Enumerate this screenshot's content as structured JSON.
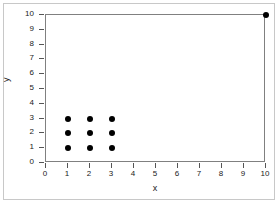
{
  "chart_data": {
    "type": "scatter",
    "title": "",
    "xlabel": "x",
    "ylabel": "y",
    "xlim": [
      0,
      10
    ],
    "ylim": [
      0,
      10
    ],
    "xticks": [
      0,
      1,
      2,
      3,
      4,
      5,
      6,
      7,
      8,
      9,
      10
    ],
    "yticks": [
      0,
      1,
      2,
      3,
      4,
      5,
      6,
      7,
      8,
      9,
      10
    ],
    "xtick_labels": [
      "0",
      "1",
      "2",
      "3",
      "4",
      "5",
      "6",
      "7",
      "8",
      "9",
      "10"
    ],
    "ytick_labels": [
      "0",
      "1",
      "2",
      "3",
      "4",
      "5",
      "6",
      "7",
      "8",
      "9",
      "10"
    ],
    "grid": false,
    "legend": null,
    "marker": "filled-circle",
    "marker_color": "#000000",
    "marker_size": 6,
    "points": [
      {
        "x": 1,
        "y": 1
      },
      {
        "x": 1,
        "y": 2
      },
      {
        "x": 1,
        "y": 3
      },
      {
        "x": 2,
        "y": 1
      },
      {
        "x": 2,
        "y": 2
      },
      {
        "x": 2,
        "y": 3
      },
      {
        "x": 3,
        "y": 1
      },
      {
        "x": 3,
        "y": 2
      },
      {
        "x": 3,
        "y": 3
      },
      {
        "x": 10,
        "y": 10
      }
    ],
    "series": [
      {
        "name": "data",
        "x": [
          1,
          1,
          1,
          2,
          2,
          2,
          3,
          3,
          3,
          10
        ],
        "y": [
          1,
          2,
          3,
          1,
          2,
          3,
          1,
          2,
          3,
          10
        ]
      }
    ]
  },
  "colors": {
    "axis_line": "#808080",
    "tick": "#555555",
    "text": "#1a1a1a",
    "outer_border": "#c8c8c8",
    "background": "#ffffff",
    "marker": "#000000"
  }
}
